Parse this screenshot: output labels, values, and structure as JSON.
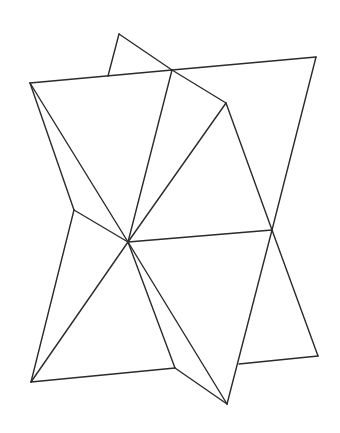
{
  "figure": {
    "stroke_color": "#2b2b2b",
    "background": "#ffffff",
    "vertices": {
      "A": [
        119,
        34
      ],
      "E": [
        172,
        70
      ],
      "F": [
        316,
        57
      ],
      "B": [
        30,
        83
      ],
      "D": [
        226,
        103
      ],
      "C": [
        128,
        242
      ],
      "G": [
        272,
        230
      ],
      "H": [
        74,
        210
      ],
      "I": [
        31,
        382
      ],
      "J": [
        175,
        368
      ],
      "K": [
        227,
        404
      ],
      "L": [
        239,
        364
      ],
      "M": [
        318,
        356
      ],
      "P": [
        108,
        76
      ]
    },
    "edges": [
      [
        "A",
        "E"
      ],
      [
        "A",
        "P"
      ],
      [
        "B",
        "E"
      ],
      [
        "E",
        "F"
      ],
      [
        "F",
        "G"
      ],
      [
        "E",
        "D"
      ],
      [
        "D",
        "G"
      ],
      [
        "E",
        "C"
      ],
      [
        "D",
        "C"
      ],
      [
        "B",
        "C"
      ],
      [
        "B",
        "H"
      ],
      [
        "H",
        "C"
      ],
      [
        "H",
        "I"
      ],
      [
        "C",
        "G"
      ],
      [
        "I",
        "J"
      ],
      [
        "I",
        "C"
      ],
      [
        "C",
        "J"
      ],
      [
        "J",
        "K"
      ],
      [
        "C",
        "K"
      ],
      [
        "G",
        "K"
      ],
      [
        "G",
        "M"
      ],
      [
        "L",
        "M"
      ]
    ]
  }
}
